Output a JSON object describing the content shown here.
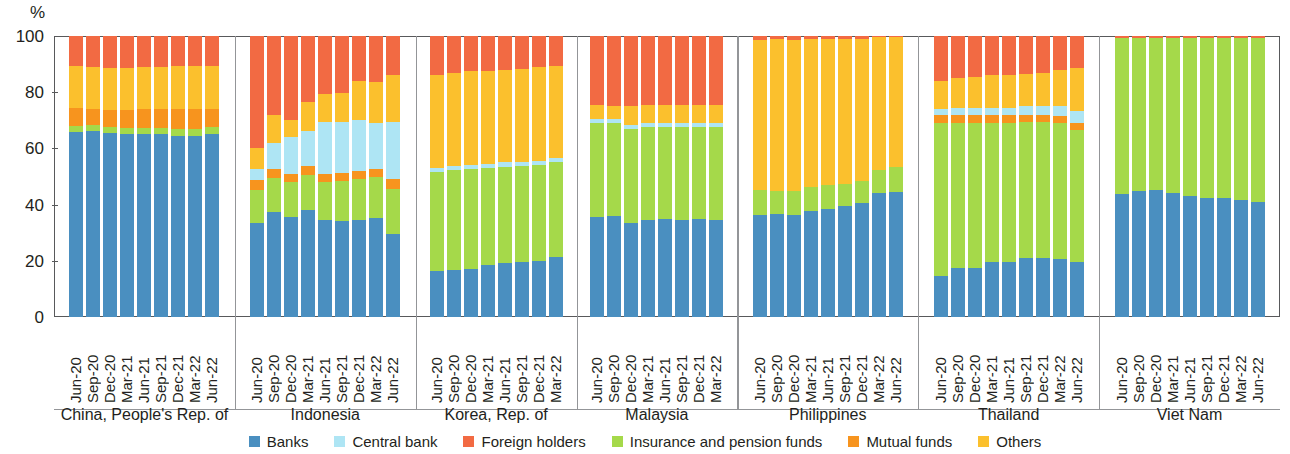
{
  "chart_data": {
    "type": "bar",
    "subtype": "stacked-100-percent-grouped",
    "title": "",
    "xlabel": "",
    "ylabel": "%",
    "ylim": [
      0,
      100
    ],
    "yticks": [
      0,
      20,
      40,
      60,
      80,
      100
    ],
    "grid": false,
    "legend_position": "bottom",
    "stack_order_bottom_to_top": [
      "Banks",
      "Insurance and pension funds",
      "Mutual funds",
      "Central bank",
      "Others",
      "Foreign holders"
    ],
    "series": [
      {
        "name": "Banks",
        "color": "#4a8fc0"
      },
      {
        "name": "Central bank",
        "color": "#aee5f4"
      },
      {
        "name": "Foreign holders",
        "color": "#f26a43"
      },
      {
        "name": "Insurance and pension funds",
        "color": "#a5d94a"
      },
      {
        "name": "Mutual funds",
        "color": "#f7941e"
      },
      {
        "name": "Others",
        "color": "#fbc02d"
      }
    ],
    "groups": [
      {
        "name": "China, People's Rep. of",
        "categories": [
          "Jun-20",
          "Sep-20",
          "Dec-20",
          "Mar-21",
          "Jun-21",
          "Sep-21",
          "Dec-21",
          "Mar-22",
          "Jun-22"
        ],
        "values": {
          "Banks": [
            66.0,
            66.2,
            65.5,
            65.3,
            65.2,
            65.0,
            64.5,
            64.5,
            65.3
          ],
          "Insurance and pension funds": [
            2.0,
            2.0,
            2.0,
            2.0,
            2.2,
            2.3,
            2.5,
            2.5,
            2.3
          ],
          "Mutual funds": [
            6.5,
            6.0,
            6.3,
            6.4,
            6.5,
            6.6,
            7.0,
            7.0,
            6.6
          ],
          "Central bank": [
            0.0,
            0.0,
            0.0,
            0.0,
            0.0,
            0.0,
            0.0,
            0.0,
            0.0
          ],
          "Others": [
            15.0,
            14.8,
            15.0,
            15.0,
            15.0,
            15.0,
            15.2,
            15.2,
            15.0
          ],
          "Foreign holders": [
            10.5,
            11.0,
            11.2,
            11.3,
            11.1,
            11.1,
            10.8,
            10.8,
            10.8
          ]
        }
      },
      {
        "name": "Indonesia",
        "categories": [
          "Jun-20",
          "Sep-20",
          "Dec-20",
          "Mar-21",
          "Jun-21",
          "Sep-21",
          "Dec-21",
          "Mar-22",
          "Jun-22"
        ],
        "values": {
          "Banks": [
            33.3,
            37.5,
            35.5,
            38.2,
            34.5,
            34.3,
            34.5,
            35.2,
            29.5
          ],
          "Insurance and pension funds": [
            12.0,
            12.0,
            12.5,
            12.5,
            13.5,
            14.0,
            14.5,
            14.5,
            16.0
          ],
          "Mutual funds": [
            3.5,
            3.0,
            3.0,
            3.0,
            3.0,
            3.0,
            3.0,
            3.0,
            3.5
          ],
          "Central bank": [
            4.0,
            9.5,
            13.0,
            12.5,
            18.5,
            18.0,
            18.0,
            16.5,
            20.5
          ],
          "Others": [
            7.5,
            10.0,
            6.0,
            10.5,
            10.0,
            10.5,
            14.0,
            14.5,
            16.5
          ],
          "Foreign holders": [
            39.7,
            28.0,
            30.0,
            23.3,
            20.5,
            20.2,
            16.0,
            16.3,
            14.0
          ]
        }
      },
      {
        "name": "Korea, Rep. of",
        "categories": [
          "Jun-20",
          "Sep-20",
          "Dec-20",
          "Mar-21",
          "Jun-21",
          "Sep-21",
          "Dec-21",
          "Mar-22"
        ],
        "values": {
          "Banks": [
            16.5,
            16.8,
            17.0,
            18.5,
            19.3,
            19.5,
            20.0,
            21.5
          ],
          "Insurance and pension funds": [
            35.0,
            35.5,
            35.5,
            34.5,
            34.2,
            34.3,
            34.0,
            33.5
          ],
          "Mutual funds": [
            0.0,
            0.0,
            0.0,
            0.0,
            0.0,
            0.0,
            0.0,
            0.0
          ],
          "Central bank": [
            1.5,
            1.5,
            1.5,
            1.5,
            1.5,
            1.5,
            1.5,
            1.5
          ],
          "Others": [
            33.0,
            33.0,
            33.5,
            33.0,
            33.0,
            33.0,
            33.5,
            33.0
          ],
          "Foreign holders": [
            14.0,
            13.2,
            12.5,
            12.5,
            12.0,
            11.7,
            11.0,
            10.5
          ]
        }
      },
      {
        "name": "Malaysia",
        "categories": [
          "Jun-20",
          "Sep-20",
          "Dec-20",
          "Mar-21",
          "Jun-21",
          "Sep-21",
          "Dec-21",
          "Mar-22"
        ],
        "values": {
          "Banks": [
            35.5,
            36.0,
            33.5,
            34.5,
            35.0,
            34.5,
            35.0,
            34.5
          ],
          "Insurance and pension funds": [
            33.5,
            33.0,
            33.5,
            33.0,
            32.5,
            33.0,
            32.5,
            33.0
          ],
          "Mutual funds": [
            0.0,
            0.0,
            0.0,
            0.0,
            0.0,
            0.0,
            0.0,
            0.0
          ],
          "Central bank": [
            1.5,
            1.5,
            1.5,
            1.5,
            1.5,
            1.5,
            1.5,
            1.5
          ],
          "Others": [
            5.0,
            4.5,
            6.5,
            6.5,
            6.5,
            6.5,
            6.5,
            6.5
          ],
          "Foreign holders": [
            24.5,
            25.0,
            25.0,
            24.5,
            24.5,
            24.5,
            24.5,
            24.5
          ]
        }
      },
      {
        "name": "Philippines",
        "categories": [
          "Jun-20",
          "Sep-20",
          "Dec-20",
          "Mar-21",
          "Jun-21",
          "Sep-21",
          "Dec-21",
          "Mar-22",
          "Jun-22"
        ],
        "values": {
          "Banks": [
            36.3,
            36.5,
            36.3,
            37.8,
            38.5,
            39.5,
            40.5,
            44.0,
            44.5
          ],
          "Insurance and pension funds": [
            9.0,
            8.5,
            8.5,
            8.5,
            8.5,
            8.0,
            8.0,
            8.5,
            9.0
          ],
          "Mutual funds": [
            0.0,
            0.0,
            0.0,
            0.0,
            0.0,
            0.0,
            0.0,
            0.0,
            0.0
          ],
          "Central bank": [
            0.0,
            0.0,
            0.0,
            0.0,
            0.0,
            0.0,
            0.0,
            0.0,
            0.0
          ],
          "Others": [
            53.2,
            54.0,
            53.7,
            52.5,
            51.8,
            51.3,
            50.3,
            47.0,
            46.2
          ],
          "Foreign holders": [
            1.5,
            1.0,
            1.5,
            1.2,
            1.2,
            1.2,
            1.2,
            0.5,
            0.3
          ]
        }
      },
      {
        "name": "Thailand",
        "categories": [
          "Jun-20",
          "Sep-20",
          "Dec-20",
          "Mar-21",
          "Jun-21",
          "Sep-21",
          "Dec-21",
          "Mar-22",
          "Jun-22"
        ],
        "values": {
          "Banks": [
            14.5,
            17.5,
            17.5,
            19.5,
            19.5,
            21.0,
            21.0,
            20.5,
            19.5
          ],
          "Insurance and pension funds": [
            54.5,
            51.5,
            51.5,
            49.5,
            49.5,
            48.5,
            48.5,
            48.5,
            47.0
          ],
          "Mutual funds": [
            3.0,
            3.0,
            3.0,
            3.0,
            3.0,
            2.5,
            2.5,
            2.5,
            2.5
          ],
          "Central bank": [
            2.0,
            2.5,
            2.5,
            2.5,
            2.5,
            3.0,
            3.0,
            3.5,
            4.5
          ],
          "Others": [
            10.0,
            10.5,
            11.0,
            11.5,
            11.5,
            11.5,
            12.0,
            13.0,
            15.0
          ],
          "Foreign holders": [
            16.0,
            15.0,
            14.5,
            14.0,
            14.0,
            13.5,
            13.0,
            12.0,
            11.5
          ]
        }
      },
      {
        "name": "Viet Nam",
        "categories": [
          "Jun-20",
          "Sep-20",
          "Dec-20",
          "Mar-21",
          "Jun-21",
          "Sep-21",
          "Dec-21",
          "Mar-22",
          "Jun-22"
        ],
        "values": {
          "Banks": [
            43.8,
            45.0,
            45.3,
            44.0,
            43.0,
            42.5,
            42.3,
            41.5,
            40.8
          ],
          "Insurance and pension funds": [
            55.4,
            54.2,
            53.9,
            55.2,
            56.2,
            56.7,
            56.9,
            57.7,
            58.4
          ],
          "Mutual funds": [
            0.0,
            0.0,
            0.0,
            0.0,
            0.0,
            0.0,
            0.0,
            0.0,
            0.0
          ],
          "Central bank": [
            0.0,
            0.0,
            0.0,
            0.0,
            0.0,
            0.0,
            0.0,
            0.0,
            0.0
          ],
          "Others": [
            0.0,
            0.0,
            0.0,
            0.0,
            0.0,
            0.0,
            0.0,
            0.0,
            0.0
          ],
          "Foreign holders": [
            0.8,
            0.8,
            0.8,
            0.8,
            0.8,
            0.8,
            0.8,
            0.8,
            0.8
          ]
        }
      }
    ]
  },
  "axis": {
    "y_unit_label": "%",
    "y_tick_labels": [
      "100",
      "80",
      "60",
      "40",
      "20",
      "0"
    ]
  },
  "legend": {
    "items": [
      {
        "label": "Banks",
        "color": "#4a8fc0"
      },
      {
        "label": "Central bank",
        "color": "#aee5f4"
      },
      {
        "label": "Foreign holders",
        "color": "#f26a43"
      },
      {
        "label": "Insurance and pension funds",
        "color": "#a5d94a"
      },
      {
        "label": "Mutual funds",
        "color": "#f7941e"
      },
      {
        "label": "Others",
        "color": "#fbc02d"
      }
    ]
  }
}
